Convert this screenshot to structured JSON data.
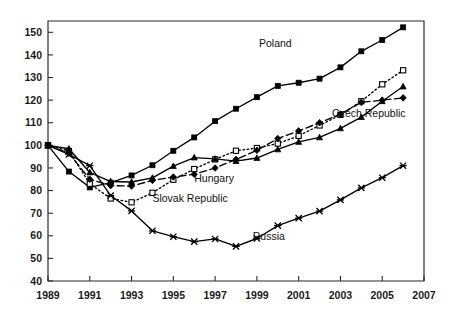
{
  "chart_data": {
    "type": "line",
    "title": "",
    "subtitle": "",
    "xlabel": "",
    "ylabel": "",
    "xlim": [
      1989,
      2007
    ],
    "ylim": [
      40,
      155
    ],
    "grid": false,
    "legend_position": "inline-annotations",
    "x": [
      1989,
      1990,
      1991,
      1992,
      1993,
      1994,
      1995,
      1996,
      1997,
      1998,
      1999,
      2000,
      2001,
      2002,
      2003,
      2004,
      2005,
      2006
    ],
    "x_tick_labels": [
      "1989",
      "1991",
      "1993",
      "1995",
      "1997",
      "1999",
      "2001",
      "2003",
      "2005",
      "2007"
    ],
    "x_tick_values": [
      1989,
      1991,
      1993,
      1995,
      1997,
      1999,
      2001,
      2003,
      2005,
      2007
    ],
    "y_tick_labels": [
      "40",
      "50",
      "60",
      "70",
      "80",
      "90",
      "100",
      "110",
      "120",
      "130",
      "140",
      "150"
    ],
    "y_tick_values": [
      40,
      50,
      60,
      70,
      80,
      90,
      100,
      110,
      120,
      130,
      140,
      150
    ],
    "series": [
      {
        "name": "Poland",
        "label": "Poland",
        "line_style": "solid",
        "marker": "filled-square",
        "color": "#000000",
        "label_x": 1999.1,
        "label_y": 143.5,
        "values": [
          100,
          88.4,
          81.4,
          83.5,
          86.7,
          91.2,
          97.6,
          103.5,
          110.7,
          116.2,
          121.3,
          126.3,
          127.7,
          129.5,
          134.5,
          141.6,
          146.6,
          152.2
        ]
      },
      {
        "name": "Slovak Republic",
        "label": "Slovak Republic",
        "line_style": "dotted",
        "marker": "open-square",
        "color": "#000000",
        "label_x": 1994.0,
        "label_y": 75.0,
        "values": [
          100,
          97.5,
          83.0,
          76.5,
          74.8,
          79.0,
          84.8,
          89.5,
          93.8,
          97.6,
          98.8,
          100.8,
          104.2,
          108.8,
          113.5,
          119.5,
          127.0,
          133.2
        ]
      },
      {
        "name": "Czech Republic",
        "label": "Czech Republic",
        "line_style": "solid",
        "marker": "filled-triangle",
        "color": "#000000",
        "label_x": 2002.6,
        "label_y": 112.5,
        "values": [
          100,
          98.5,
          88.0,
          84.0,
          83.8,
          85.6,
          90.8,
          94.6,
          94.0,
          93.0,
          94.4,
          98.2,
          101.5,
          103.5,
          107.5,
          112.5,
          119.5,
          126.0
        ]
      },
      {
        "name": "Hungary",
        "label": "Hungary",
        "line_style": "dashed",
        "marker": "filled-diamond",
        "color": "#000000",
        "label_x": 1996.0,
        "label_y": 84.0,
        "values": [
          100,
          96.5,
          85.0,
          82.2,
          82.0,
          84.5,
          86.0,
          87.2,
          90.0,
          93.8,
          97.8,
          103.0,
          106.4,
          110.0,
          113.8,
          119.0,
          120.0,
          121.0
        ]
      },
      {
        "name": "Russia",
        "label": "Russia",
        "line_style": "solid",
        "marker": "cross",
        "color": "#000000",
        "label_x": 1998.8,
        "label_y": 58.0,
        "values": [
          100,
          96.0,
          91.0,
          77.8,
          71.0,
          62.2,
          59.6,
          57.4,
          58.6,
          55.3,
          58.8,
          64.5,
          67.8,
          70.9,
          75.9,
          81.2,
          85.7,
          91.0
        ]
      }
    ]
  },
  "axes": {
    "x_ticks": [
      "1989",
      "1991",
      "1993",
      "1995",
      "1997",
      "1999",
      "2001",
      "2003",
      "2005",
      "2007"
    ],
    "y_ticks": [
      "150",
      "140",
      "130",
      "120",
      "110",
      "100",
      "90",
      "80",
      "70",
      "60",
      "50",
      "40"
    ]
  }
}
